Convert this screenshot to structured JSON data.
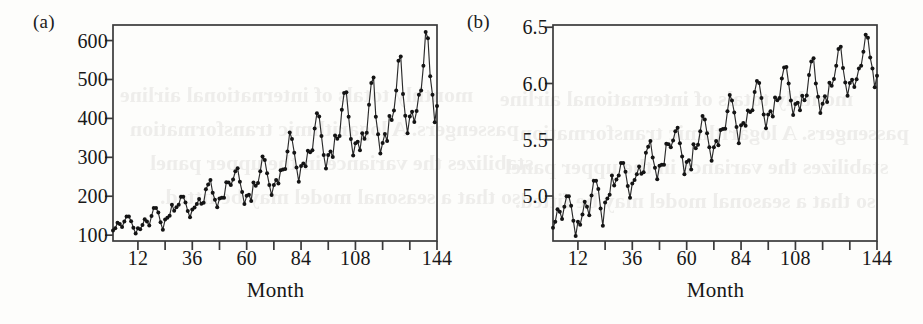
{
  "figure": {
    "background_color": "#fdfdfb",
    "ink_color": "#202020"
  },
  "panels": [
    {
      "tag": "(a)",
      "xlabel": "Month",
      "ylabel": "",
      "y_ticks": [
        "100",
        "200",
        "300",
        "400",
        "500",
        "600"
      ],
      "x_ticks": [
        "12",
        "36",
        "60",
        "84",
        "108",
        "144"
      ]
    },
    {
      "tag": "(b)",
      "xlabel": "Month",
      "ylabel": "",
      "y_ticks": [
        "5.0",
        "5.5",
        "6.0",
        "6.5"
      ],
      "x_ticks": [
        "12",
        "36",
        "60",
        "84",
        "108",
        "144"
      ]
    }
  ],
  "bleed_through_text": [
    "monthly totals of international airline",
    "passengers. A logarithmic transformation",
    "stabilizes the variance in the upper panel",
    "so that a seasonal model may be fitted."
  ],
  "chart_data": [
    {
      "type": "line",
      "panel": "(a)",
      "title": "",
      "xlabel": "Month",
      "ylabel": "",
      "xlim": [
        1,
        144
      ],
      "ylim": [
        85,
        640
      ],
      "x_tick_values": [
        12,
        36,
        60,
        84,
        108,
        144
      ],
      "x_minor_tick_values": [
        24,
        48,
        72,
        96,
        120,
        132
      ],
      "x_tick_labels": [
        "12",
        "36",
        "60",
        "84",
        "108",
        "144"
      ],
      "y_tick_values": [
        100,
        200,
        300,
        400,
        500,
        600
      ],
      "y_tick_labels": [
        "100",
        "200",
        "300",
        "400",
        "500",
        "600"
      ],
      "grid": false,
      "legend": false,
      "marker": "filled-circle",
      "x": [
        1,
        2,
        3,
        4,
        5,
        6,
        7,
        8,
        9,
        10,
        11,
        12,
        13,
        14,
        15,
        16,
        17,
        18,
        19,
        20,
        21,
        22,
        23,
        24,
        25,
        26,
        27,
        28,
        29,
        30,
        31,
        32,
        33,
        34,
        35,
        36,
        37,
        38,
        39,
        40,
        41,
        42,
        43,
        44,
        45,
        46,
        47,
        48,
        49,
        50,
        51,
        52,
        53,
        54,
        55,
        56,
        57,
        58,
        59,
        60,
        61,
        62,
        63,
        64,
        65,
        66,
        67,
        68,
        69,
        70,
        71,
        72,
        73,
        74,
        75,
        76,
        77,
        78,
        79,
        80,
        81,
        82,
        83,
        84,
        85,
        86,
        87,
        88,
        89,
        90,
        91,
        92,
        93,
        94,
        95,
        96,
        97,
        98,
        99,
        100,
        101,
        102,
        103,
        104,
        105,
        106,
        107,
        108,
        109,
        110,
        111,
        112,
        113,
        114,
        115,
        116,
        117,
        118,
        119,
        120,
        121,
        122,
        123,
        124,
        125,
        126,
        127,
        128,
        129,
        130,
        131,
        132,
        133,
        134,
        135,
        136,
        137,
        138,
        139,
        140,
        141,
        142,
        143,
        144
      ],
      "values": [
        112,
        118,
        132,
        129,
        121,
        135,
        148,
        148,
        136,
        119,
        104,
        118,
        115,
        126,
        141,
        135,
        125,
        149,
        170,
        170,
        158,
        133,
        114,
        140,
        145,
        150,
        178,
        163,
        172,
        178,
        199,
        199,
        184,
        162,
        146,
        166,
        171,
        180,
        193,
        181,
        183,
        218,
        230,
        242,
        209,
        191,
        172,
        194,
        196,
        196,
        236,
        235,
        229,
        243,
        264,
        272,
        237,
        211,
        180,
        201,
        204,
        188,
        235,
        227,
        234,
        264,
        302,
        293,
        259,
        229,
        203,
        229,
        242,
        233,
        267,
        269,
        270,
        315,
        364,
        347,
        312,
        274,
        237,
        278,
        284,
        277,
        317,
        313,
        318,
        374,
        413,
        405,
        355,
        306,
        271,
        306,
        315,
        301,
        356,
        348,
        355,
        422,
        465,
        467,
        404,
        347,
        305,
        336,
        340,
        318,
        362,
        348,
        363,
        435,
        491,
        505,
        404,
        359,
        310,
        337,
        360,
        342,
        406,
        396,
        420,
        472,
        548,
        559,
        463,
        407,
        362,
        405,
        417,
        391,
        419,
        461,
        472,
        535,
        622,
        606,
        508,
        461,
        390,
        432
      ]
    },
    {
      "type": "line",
      "panel": "(b)",
      "title": "",
      "xlabel": "Month",
      "ylabel": "",
      "xlim": [
        1,
        144
      ],
      "ylim": [
        4.6,
        6.52
      ],
      "x_tick_values": [
        12,
        36,
        60,
        84,
        108,
        144
      ],
      "x_minor_tick_values": [
        24,
        48,
        72,
        96,
        120,
        132
      ],
      "x_tick_labels": [
        "12",
        "36",
        "60",
        "84",
        "108",
        "144"
      ],
      "y_tick_values": [
        5.0,
        5.5,
        6.0,
        6.5
      ],
      "y_tick_labels": [
        "5.0",
        "5.5",
        "6.0",
        "6.5"
      ],
      "grid": false,
      "legend": false,
      "marker": "filled-circle",
      "transform": "natural log of panel (a)",
      "x": [
        1,
        2,
        3,
        4,
        5,
        6,
        7,
        8,
        9,
        10,
        11,
        12,
        13,
        14,
        15,
        16,
        17,
        18,
        19,
        20,
        21,
        22,
        23,
        24,
        25,
        26,
        27,
        28,
        29,
        30,
        31,
        32,
        33,
        34,
        35,
        36,
        37,
        38,
        39,
        40,
        41,
        42,
        43,
        44,
        45,
        46,
        47,
        48,
        49,
        50,
        51,
        52,
        53,
        54,
        55,
        56,
        57,
        58,
        59,
        60,
        61,
        62,
        63,
        64,
        65,
        66,
        67,
        68,
        69,
        70,
        71,
        72,
        73,
        74,
        75,
        76,
        77,
        78,
        79,
        80,
        81,
        82,
        83,
        84,
        85,
        86,
        87,
        88,
        89,
        90,
        91,
        92,
        93,
        94,
        95,
        96,
        97,
        98,
        99,
        100,
        101,
        102,
        103,
        104,
        105,
        106,
        107,
        108,
        109,
        110,
        111,
        112,
        113,
        114,
        115,
        116,
        117,
        118,
        119,
        120,
        121,
        122,
        123,
        124,
        125,
        126,
        127,
        128,
        129,
        130,
        131,
        132,
        133,
        134,
        135,
        136,
        137,
        138,
        139,
        140,
        141,
        142,
        143,
        144
      ],
      "values": [
        4.718,
        4.771,
        4.883,
        4.86,
        4.796,
        4.905,
        4.997,
        4.997,
        4.913,
        4.779,
        4.644,
        4.771,
        4.745,
        4.836,
        4.949,
        4.905,
        4.828,
        5.004,
        5.136,
        5.136,
        5.063,
        4.89,
        4.736,
        4.942,
        4.977,
        5.011,
        5.182,
        5.094,
        5.147,
        5.182,
        5.293,
        5.293,
        5.215,
        5.088,
        4.984,
        5.112,
        5.142,
        5.193,
        5.263,
        5.198,
        5.21,
        5.385,
        5.438,
        5.489,
        5.342,
        5.252,
        5.148,
        5.268,
        5.278,
        5.278,
        5.464,
        5.46,
        5.434,
        5.493,
        5.576,
        5.606,
        5.468,
        5.352,
        5.193,
        5.303,
        5.318,
        5.236,
        5.46,
        5.425,
        5.455,
        5.576,
        5.71,
        5.68,
        5.557,
        5.434,
        5.313,
        5.434,
        5.489,
        5.451,
        5.587,
        5.595,
        5.598,
        5.753,
        5.897,
        5.849,
        5.743,
        5.613,
        5.468,
        5.628,
        5.649,
        5.624,
        5.759,
        5.746,
        5.762,
        5.924,
        6.023,
        6.004,
        5.872,
        5.724,
        5.602,
        5.724,
        5.753,
        5.707,
        5.875,
        5.852,
        5.872,
        6.045,
        6.142,
        6.146,
        6.001,
        5.849,
        5.72,
        5.817,
        5.829,
        5.762,
        5.892,
        5.852,
        5.894,
        6.075,
        6.196,
        6.225,
        6.001,
        5.883,
        5.737,
        5.82,
        5.886,
        5.835,
        6.006,
        5.981,
        6.04,
        6.157,
        6.306,
        6.326,
        6.138,
        6.009,
        5.892,
        6.004,
        6.033,
        5.969,
        6.038,
        6.133,
        6.157,
        6.282,
        6.433,
        6.407,
        6.23,
        6.133,
        5.966,
        6.069
      ]
    }
  ]
}
